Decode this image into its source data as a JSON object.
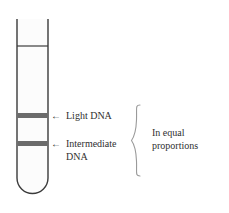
{
  "figure": {
    "type": "diagram",
    "tube": {
      "name": "centrifuge-tube",
      "outline_color": "#3b3b3b",
      "fill_color": "#fcfcfc",
      "left_x": 17,
      "right_x": 48,
      "top_y": 19,
      "bottom_y": 193,
      "rim_line_y": 46
    },
    "bands": [
      {
        "id": "band-light-dna",
        "label": "Light DNA",
        "arrow": "←",
        "color": "#6b6b6b",
        "y": 115,
        "thickness": 5
      },
      {
        "id": "band-intermediate-dna",
        "label_line1": "Intermediate",
        "label_line2": "DNA",
        "arrow": "←",
        "color": "#6b6b6b",
        "y": 143,
        "thickness": 5
      }
    ],
    "brace": {
      "name": "equal-proportions-brace",
      "color": "#8c8c8c",
      "top_y": 105,
      "bottom_y": 178,
      "x": 136
    },
    "annotation": {
      "line1": "In equal",
      "line2": "proportions"
    }
  }
}
